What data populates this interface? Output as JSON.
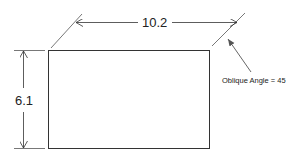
{
  "diagram": {
    "width_dimension": "10.2",
    "height_dimension": "6.1",
    "annotation": "Oblique Angle = 45",
    "colors": {
      "line": "#333333",
      "leader": "#555555",
      "text": "#222222",
      "background": "#ffffff"
    }
  }
}
